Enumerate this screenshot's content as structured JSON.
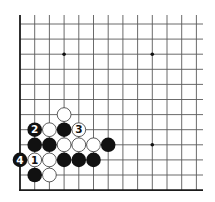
{
  "diagram": {
    "type": "go-board-corner",
    "corner": "bottom-left",
    "colors": {
      "background": "#ffffff",
      "grid_line": "#5a5a5a",
      "edge_line": "#1a1a1a",
      "black_stone": "#111111",
      "white_stone": "#ffffff",
      "white_stone_outline": "#333333",
      "star_point": "#111111"
    },
    "grid": {
      "origin_x": 20,
      "origin_y": 24,
      "col_spacing": 14.7,
      "row_spacing": 15.1,
      "cols": 13,
      "rows": 12,
      "right_extent": 203,
      "top_extent": 15,
      "edges": [
        "left",
        "bottom"
      ]
    },
    "star_points": [
      {
        "col": 3,
        "row": 2
      },
      {
        "col": 9,
        "row": 2
      },
      {
        "col": 9,
        "row": 8
      }
    ],
    "stones": [
      {
        "color": "white",
        "col": 3,
        "row": 6,
        "label": ""
      },
      {
        "color": "black",
        "col": 1,
        "row": 7,
        "label": "2"
      },
      {
        "color": "white",
        "col": 2,
        "row": 7,
        "label": ""
      },
      {
        "color": "black",
        "col": 3,
        "row": 7,
        "label": ""
      },
      {
        "color": "white",
        "col": 4,
        "row": 7,
        "label": "3"
      },
      {
        "color": "black",
        "col": 1,
        "row": 8,
        "label": ""
      },
      {
        "color": "black",
        "col": 2,
        "row": 8,
        "label": ""
      },
      {
        "color": "white",
        "col": 3,
        "row": 8,
        "label": ""
      },
      {
        "color": "white",
        "col": 4,
        "row": 8,
        "label": ""
      },
      {
        "color": "white",
        "col": 5,
        "row": 8,
        "label": ""
      },
      {
        "color": "black",
        "col": 6,
        "row": 8,
        "label": ""
      },
      {
        "color": "black",
        "col": 0,
        "row": 9,
        "label": "4"
      },
      {
        "color": "white",
        "col": 1,
        "row": 9,
        "label": "1"
      },
      {
        "color": "white",
        "col": 2,
        "row": 9,
        "label": ""
      },
      {
        "color": "black",
        "col": 3,
        "row": 9,
        "label": ""
      },
      {
        "color": "black",
        "col": 4,
        "row": 9,
        "label": ""
      },
      {
        "color": "black",
        "col": 5,
        "row": 9,
        "label": ""
      },
      {
        "color": "black",
        "col": 1,
        "row": 10,
        "label": ""
      },
      {
        "color": "white",
        "col": 2,
        "row": 10,
        "label": ""
      }
    ],
    "move_labels": [
      "1",
      "2",
      "3",
      "4"
    ]
  }
}
